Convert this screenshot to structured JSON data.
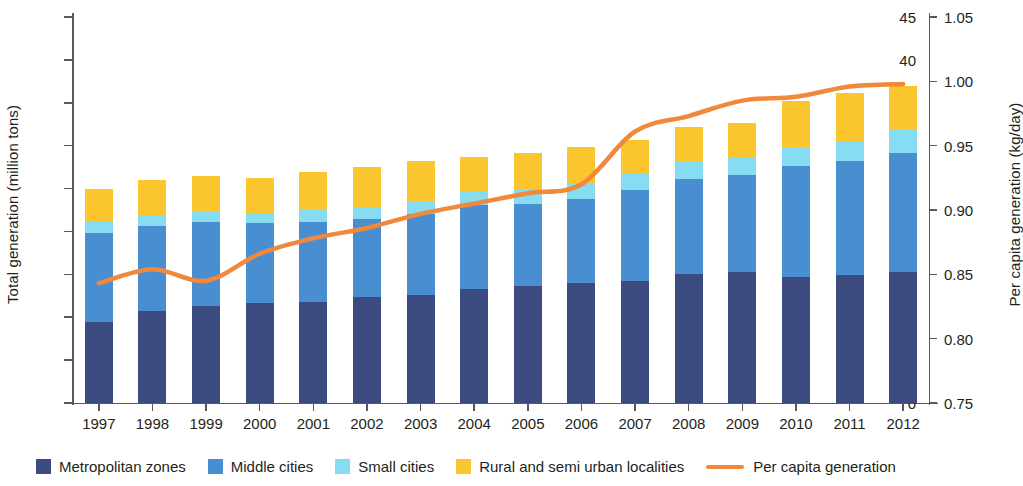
{
  "chart_data": {
    "type": "bar",
    "title": "",
    "subtitle": "",
    "xlabel": "",
    "ylabel": "Total generation (million tons)",
    "y2label": "Per capita generation (kg/day)",
    "ylim": [
      0,
      45
    ],
    "y2lim": [
      0.75,
      1.05
    ],
    "yticks": [
      "0",
      "5",
      "10",
      "15",
      "20",
      "25",
      "30",
      "35",
      "40",
      "45"
    ],
    "y2ticks": [
      "0.75",
      "0.80",
      "0.85",
      "0.90",
      "0.95",
      "1.00",
      "1.05"
    ],
    "grid": false,
    "legend_position": "bottom",
    "stacked": true,
    "categories": [
      "1997",
      "1998",
      "1999",
      "2000",
      "2001",
      "2002",
      "2003",
      "2004",
      "2005",
      "2006",
      "2007",
      "2008",
      "2009",
      "2010",
      "2011",
      "2012"
    ],
    "series": [
      {
        "name": "Metropolitan zones",
        "color": "#3b4a7f",
        "values": [
          9.4,
          10.7,
          11.3,
          11.6,
          11.8,
          12.4,
          12.6,
          13.3,
          13.6,
          14.0,
          14.2,
          15.0,
          15.3,
          14.7,
          14.9,
          15.3
        ]
      },
      {
        "name": "Middle cities",
        "color": "#4a8ed2",
        "values": [
          10.4,
          9.9,
          9.8,
          9.4,
          9.3,
          9.0,
          9.4,
          9.8,
          9.6,
          9.8,
          10.6,
          11.1,
          11.3,
          12.9,
          13.3,
          13.8
        ]
      },
      {
        "name": "Small cities",
        "color": "#86dcf1",
        "values": [
          1.4,
          1.3,
          1.2,
          1.2,
          1.4,
          1.3,
          1.5,
          1.6,
          1.6,
          1.8,
          1.9,
          2.0,
          2.1,
          2.1,
          2.4,
          2.8
        ]
      },
      {
        "name": "Rural and semi urban localities",
        "color": "#fbc52d",
        "values": [
          3.8,
          4.1,
          4.2,
          4.0,
          4.4,
          4.8,
          4.7,
          4.0,
          4.4,
          4.2,
          4.0,
          4.1,
          4.0,
          5.5,
          5.5,
          5.1
        ]
      }
    ],
    "line_series": {
      "name": "Per capita generation",
      "color": "#f0893c",
      "axis": "right",
      "values": [
        0.843,
        0.854,
        0.845,
        0.866,
        0.878,
        0.886,
        0.897,
        0.905,
        0.913,
        0.92,
        0.961,
        0.973,
        0.985,
        0.988,
        0.996,
        0.998
      ]
    },
    "totals": [
      25.0,
      26.0,
      26.5,
      26.2,
      26.9,
      27.5,
      28.2,
      34.7,
      35.2,
      35.8,
      36.6,
      37.2,
      37.7,
      39.2,
      40.1,
      41.0
    ]
  },
  "legend": {
    "items": [
      {
        "label": "Metropolitan zones",
        "color": "#3b4a7f",
        "marker": "square"
      },
      {
        "label": "Middle cities",
        "color": "#4a8ed2",
        "marker": "square"
      },
      {
        "label": "Small cities",
        "color": "#86dcf1",
        "marker": "square"
      },
      {
        "label": "Rural and semi urban localities",
        "color": "#fbc52d",
        "marker": "square"
      },
      {
        "label": "Per capita generation",
        "color": "#f0893c",
        "marker": "line"
      }
    ]
  },
  "axes": {
    "left_title": "Total generation (million tons)",
    "right_title": "Per capita generation (kg/day)"
  }
}
